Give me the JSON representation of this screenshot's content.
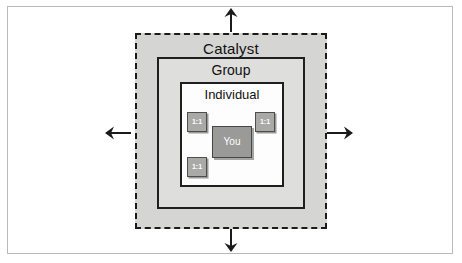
{
  "figure": {
    "name": "concentric-influence-diagram",
    "layers": {
      "catalyst": {
        "label": "Catalyst",
        "fill": "#d5d5d3",
        "border": "#1b1b1b",
        "border_style": "dashed"
      },
      "group": {
        "label": "Group",
        "fill": "#dededc",
        "border": "#201f1f",
        "border_style": "solid"
      },
      "individual": {
        "label": "Individual",
        "fill": "#fdfdfd",
        "border": "#201f1f",
        "border_style": "solid"
      }
    },
    "nodes": {
      "you": {
        "label": "You",
        "fill": "#9a9a98",
        "text_color": "#ffffff"
      },
      "one_on_one": {
        "label": "1:1",
        "fill": "#a9a9a7",
        "text_color": "#ffffff",
        "count": 3
      }
    },
    "arrows": [
      {
        "name": "arrow-up",
        "direction": "up"
      },
      {
        "name": "arrow-right",
        "direction": "right"
      },
      {
        "name": "arrow-down",
        "direction": "down"
      },
      {
        "name": "arrow-left",
        "direction": "left"
      }
    ],
    "frame": {
      "border_color": "#b9b9b9",
      "background": "#ffffff"
    }
  }
}
